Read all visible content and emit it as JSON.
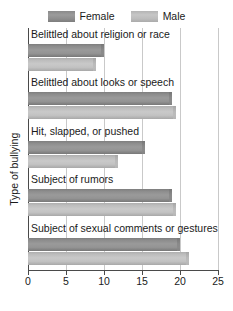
{
  "legend": {
    "position": "top-center",
    "entries": [
      {
        "label": "Female",
        "swatch": "female-swatch",
        "color": "#919191"
      },
      {
        "label": "Male",
        "swatch": "male-swatch",
        "color": "#c0c0c0"
      }
    ]
  },
  "axes": {
    "x_title": "Percentage experiencing bullying",
    "y_title": "Type of bullying",
    "x_ticks": [
      "0",
      "5",
      "10",
      "15",
      "20",
      "25"
    ]
  },
  "chart_data": {
    "type": "bar",
    "orientation": "horizontal",
    "title": "",
    "xlabel": "Percentage experiencing bullying",
    "ylabel": "Type of bullying",
    "xlim": [
      0,
      25
    ],
    "xticks": [
      0,
      5,
      10,
      15,
      20,
      25
    ],
    "grid": true,
    "legend_position": "top-center",
    "categories": [
      "Belittled about religion or race",
      "Belittled about looks or speech",
      "Hit, slapped, or pushed",
      "Subject of rumors",
      "Subject of sexual comments or gestures"
    ],
    "series": [
      {
        "name": "Female",
        "color": "#919191",
        "values": [
          10,
          19,
          15.4,
          19,
          20
        ]
      },
      {
        "name": "Male",
        "color": "#c0c0c0",
        "values": [
          9,
          19.5,
          11.8,
          19.5,
          21.2
        ]
      }
    ]
  }
}
